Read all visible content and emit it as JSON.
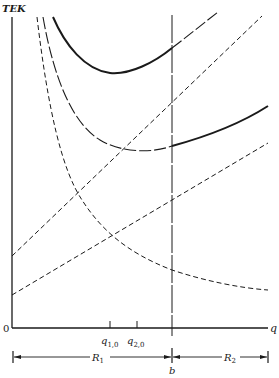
{
  "diagram": {
    "y_axis_label": "TEK",
    "x_axis_label": "q",
    "origin_label": "0",
    "tick_labels": [
      {
        "main": "q",
        "sub": "1,0"
      },
      {
        "main": "q",
        "sub": "2,0"
      }
    ],
    "boundary_label": "b",
    "regions": [
      {
        "main": "R",
        "sub": "1"
      },
      {
        "main": "R",
        "sub": "2"
      }
    ],
    "colors": {
      "ink": "#1a1a1a",
      "background": "#ffffff"
    }
  }
}
